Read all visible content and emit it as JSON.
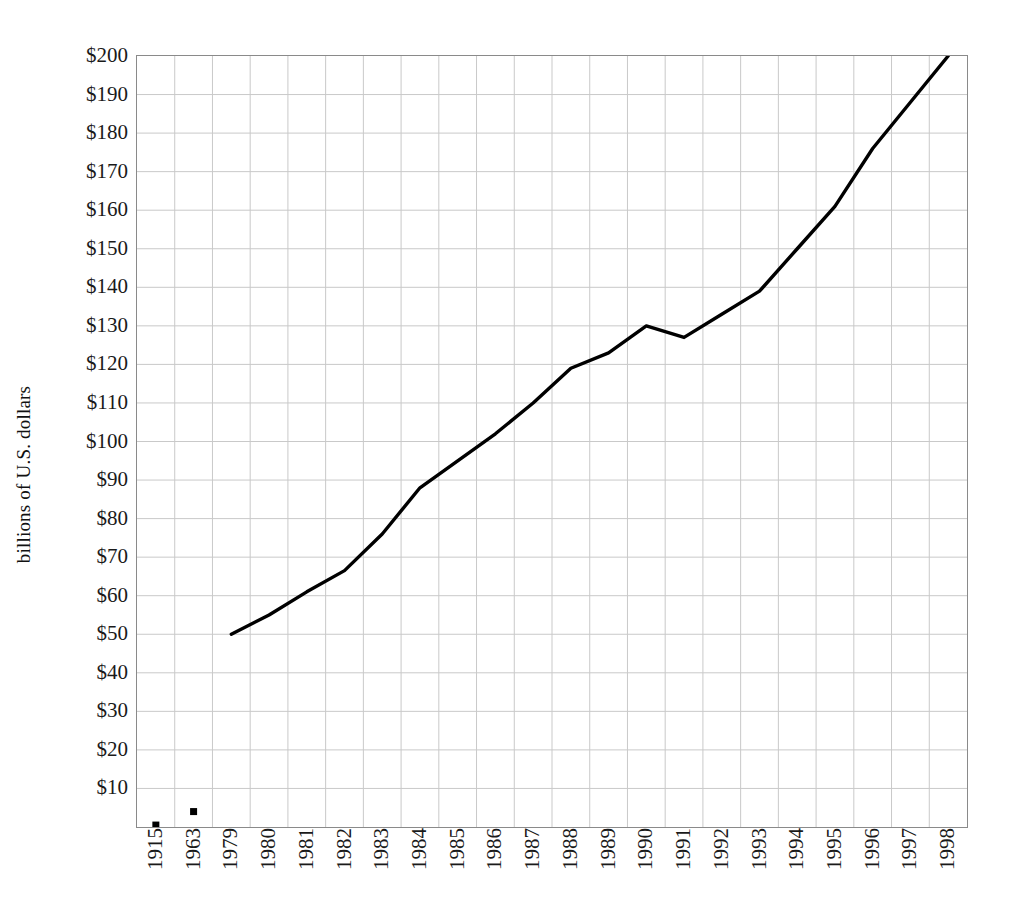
{
  "chart_data": {
    "type": "line",
    "title": "",
    "subtitle": "",
    "xlabel": "",
    "ylabel": "billions of U.S. dollars",
    "categories": [
      "1915",
      "1963",
      "1979",
      "1980",
      "1981",
      "1982",
      "1983",
      "1984",
      "1985",
      "1986",
      "1987",
      "1988",
      "1989",
      "1990",
      "1991",
      "1992",
      "1993",
      "1994",
      "1995",
      "1996",
      "1997",
      "1998"
    ],
    "values": [
      0.5,
      4,
      50,
      55,
      61,
      66.5,
      76,
      88,
      95,
      102,
      110,
      119,
      123,
      130,
      127,
      133,
      139,
      150,
      161,
      176,
      188,
      200
    ],
    "series": [
      {
        "name": "billions of U.S. dollars",
        "categories": [
          "1915",
          "1963",
          "1979",
          "1980",
          "1981",
          "1982",
          "1983",
          "1984",
          "1985",
          "1986",
          "1987",
          "1988",
          "1989",
          "1990",
          "1991",
          "1992",
          "1993",
          "1994",
          "1995",
          "1996",
          "1997",
          "1998"
        ],
        "values": [
          0.5,
          4,
          50,
          55,
          61,
          66.5,
          76,
          88,
          95,
          102,
          110,
          119,
          123,
          130,
          127,
          133,
          139,
          150,
          161,
          176,
          188,
          200
        ],
        "color": "#000000",
        "line_from_index": 2,
        "marker_indices": [
          0,
          1
        ]
      }
    ],
    "ylim": [
      0,
      200
    ],
    "ytick_values": [
      10,
      20,
      30,
      40,
      50,
      60,
      70,
      80,
      90,
      100,
      110,
      120,
      130,
      140,
      150,
      160,
      170,
      180,
      190,
      200
    ],
    "ytick_labels": [
      "$10",
      "$20",
      "$30",
      "$40",
      "$50",
      "$60",
      "$70",
      "$80",
      "$90",
      "$100",
      "$110",
      "$120",
      "$130",
      "$140",
      "$150",
      "$160",
      "$170",
      "$180",
      "$190",
      "$200"
    ],
    "grid": {
      "horizontal": true,
      "vertical": true,
      "color": "#c9c9c9"
    },
    "legend": {
      "visible": false,
      "position": "none",
      "entries": []
    },
    "plot_border_color": "#8a8a8a",
    "background_color": "#ffffff",
    "annotations": []
  }
}
